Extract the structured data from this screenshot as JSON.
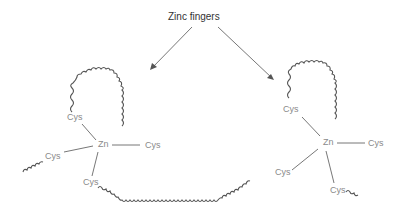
{
  "diagram": {
    "title": "Zinc fingers",
    "colors": {
      "line": "#666666",
      "label": "#8a8a8a",
      "title": "#333333"
    },
    "left_finger": {
      "center_label": "Zn",
      "ligands": [
        "Cys",
        "Cys",
        "Cys",
        "Cys"
      ]
    },
    "right_finger": {
      "center_label": "Zn",
      "ligands": [
        "Cys",
        "Cys",
        "Cys",
        "Cys"
      ]
    }
  }
}
